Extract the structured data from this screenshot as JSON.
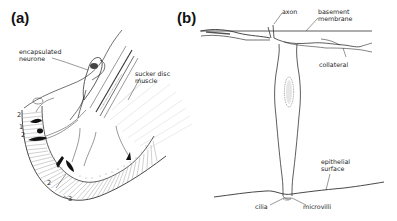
{
  "figure": {
    "panels": [
      {
        "id": "a",
        "label": "(a)",
        "annotations": {
          "encapsulated_neurone": [
            "encapsulated",
            "neurone"
          ],
          "sucker_disc_muscle": [
            "sucker disc",
            "muscle"
          ]
        },
        "layer_numbers": [
          "2",
          "1",
          "2",
          "2",
          "3"
        ]
      },
      {
        "id": "b",
        "label": "(b)",
        "annotations": {
          "axon": "axon",
          "basement_membrane": [
            "basement",
            "membrane"
          ],
          "collateral": "collateral",
          "epithelial_surface": [
            "epithelial",
            "surface"
          ],
          "cilia": "cilia",
          "microvilli": "microvilli"
        }
      }
    ],
    "colors": {
      "ink": "#222222",
      "background": "#ffffff",
      "stipple": "#9a9a9a"
    }
  }
}
